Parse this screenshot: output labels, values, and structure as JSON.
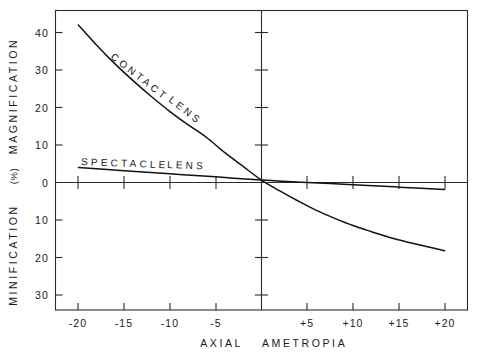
{
  "chart_data": {
    "type": "line",
    "title": "",
    "xlabel": "AXIAL AMETROPIA",
    "ylabel_upper": "MAGNIFICATION",
    "ylabel_lower": "MINIFICATION",
    "ylabel_units": "(%)",
    "xlim": [
      -22.5,
      22.5
    ],
    "ylim": [
      -36,
      47
    ],
    "grid": false,
    "legend": "inline-curve-labels",
    "xticks": [
      -20,
      -15,
      -10,
      -5,
      5,
      10,
      15,
      20
    ],
    "xtick_labels": [
      "-20",
      "-15",
      "-10",
      "-5",
      "+5",
      "+10",
      "+15",
      "+20"
    ],
    "yticks_upper": [
      0,
      10,
      20,
      30,
      40
    ],
    "ytick_labels_upper": [
      "0",
      "10",
      "20",
      "30",
      "40"
    ],
    "yticks_lower": [
      10,
      20,
      30
    ],
    "ytick_labels_lower": [
      "10",
      "20",
      "30"
    ],
    "series": [
      {
        "name": "CONTACT LENS",
        "label": "CONTACT LENS",
        "color": "#111111",
        "x": [
          -20,
          -18,
          -16,
          -14,
          -12,
          -10,
          -8,
          -6,
          -4,
          -2,
          0,
          2,
          4,
          6,
          8,
          10,
          12,
          14,
          16,
          18,
          20
        ],
        "y": [
          43.0,
          37.4,
          32.2,
          27.5,
          23.1,
          19.0,
          15.3,
          11.8,
          7.6,
          3.8,
          0.0,
          -3.0,
          -5.8,
          -8.4,
          -10.6,
          -12.6,
          -14.3,
          -15.9,
          -17.2,
          -18.4,
          -19.6
        ]
      },
      {
        "name": "SPECTACLE LENS",
        "label": "SPECTACLE LENS",
        "color": "#111111",
        "x": [
          -20,
          -15,
          -10,
          -5,
          0,
          5,
          10,
          15,
          20
        ],
        "y": [
          3.5,
          2.6,
          1.75,
          0.9,
          0.0,
          -0.65,
          -1.3,
          -1.95,
          -2.6
        ]
      }
    ]
  },
  "labels": {
    "y_upper": "MAGNIFICATION",
    "y_lower": "MINIFICATION",
    "y_units": "(%)",
    "x_word_1": "AXIAL",
    "x_word_2": "AMETROPIA",
    "curve_contact": "CONTACT",
    "curve_contact_2": "LENS",
    "curve_spectacle": "SPECTACLE",
    "curve_spectacle_2": "LENS"
  },
  "ticks": {
    "y_40": "40",
    "y_30": "30",
    "y_20": "20",
    "y_10": "10",
    "y_0": "0",
    "y_n10": "10",
    "y_n20": "20",
    "y_n30": "30",
    "x_n20": "-20",
    "x_n15": "-15",
    "x_n10": "-10",
    "x_n5": "-5",
    "x_p5": "+5",
    "x_p10": "+10",
    "x_p15": "+15",
    "x_p20": "+20"
  }
}
